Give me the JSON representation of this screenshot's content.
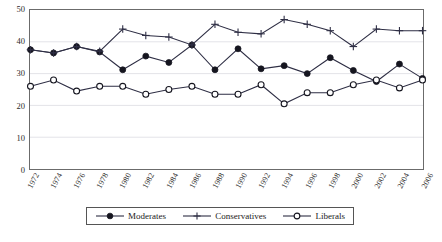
{
  "chart_data": {
    "type": "line",
    "title": "",
    "xlabel": "",
    "ylabel": "",
    "ylim": [
      0,
      50
    ],
    "yticks": [
      0,
      10,
      20,
      30,
      40,
      50
    ],
    "grid": true,
    "legend_position": "bottom",
    "categories": [
      "1972",
      "1974",
      "1976",
      "1978",
      "1980",
      "1982",
      "1984",
      "1986",
      "1988",
      "1990",
      "1992",
      "1994",
      "1996",
      "1998",
      "2000",
      "2002",
      "2004",
      "2006"
    ],
    "series": [
      {
        "name": "Moderates",
        "marker": "filled-circle",
        "values": [
          37.5,
          36.5,
          38.5,
          36.8,
          31.2,
          35.5,
          33.5,
          39.0,
          31.2,
          37.8,
          31.5,
          32.5,
          30.0,
          35.0,
          31.0,
          27.5,
          33.0,
          28.5
        ]
      },
      {
        "name": "Conservatives",
        "marker": "plus",
        "values": [
          37.5,
          36.5,
          38.5,
          37.0,
          44.0,
          42.0,
          41.5,
          39.0,
          45.5,
          43.0,
          42.5,
          47.0,
          45.5,
          43.5,
          38.5,
          44.0,
          43.5,
          43.5
        ]
      },
      {
        "name": "Liberals",
        "marker": "open-circle",
        "values": [
          26.0,
          28.0,
          24.5,
          26.0,
          26.0,
          23.5,
          25.0,
          26.0,
          23.5,
          23.5,
          26.5,
          20.5,
          24.0,
          24.0,
          26.5,
          28.0,
          25.5,
          28.0
        ]
      }
    ]
  },
  "legend": {
    "items": [
      {
        "label": "Moderates",
        "marker": "filled-circle"
      },
      {
        "label": "Conservatives",
        "marker": "plus"
      },
      {
        "label": "Liberals",
        "marker": "open-circle"
      }
    ]
  },
  "caption": {
    "text": ""
  },
  "colors": {
    "line": "#2e2e44",
    "grid": "#e3e3e8",
    "axis": "#6b6b6b",
    "text": "#1a1a1a"
  }
}
